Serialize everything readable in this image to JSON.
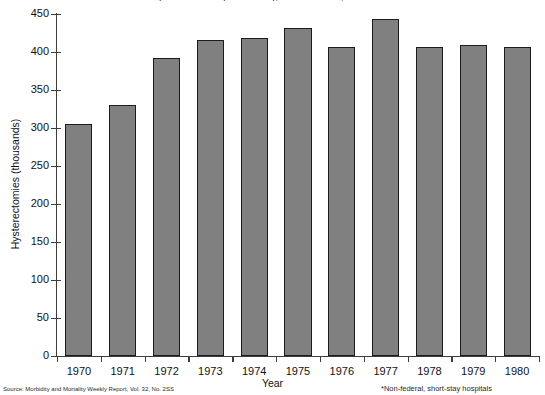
{
  "chart_data": {
    "type": "bar",
    "title": "Hysterectomies (thousands), United States, 1970-1980",
    "xlabel": "Year",
    "ylabel": "Hysterectomies (thousands)",
    "categories": [
      "1970",
      "1971",
      "1972",
      "1973",
      "1974",
      "1975",
      "1976",
      "1977",
      "1978",
      "1979",
      "1980"
    ],
    "values": [
      305,
      330,
      392,
      416,
      418,
      431,
      406,
      443,
      406,
      409,
      406
    ],
    "ylim": [
      0,
      450
    ],
    "ytick_values": [
      0,
      50,
      100,
      150,
      200,
      250,
      300,
      350,
      400,
      450
    ],
    "ytick_labels": [
      "0",
      "50",
      "100",
      "150",
      "200",
      "250",
      "300",
      "350",
      "400",
      "450"
    ],
    "grid": false,
    "legend": "none",
    "bar_color": "#808080",
    "bar_edge_color": "#1c1c1c",
    "axis_color": "#3d3d3d"
  },
  "notes": {
    "source": "Source: Morbidity and Mortality Weekly Report, Vol. 32, No. 2SS",
    "footnote": "*Non-federal, short-stay hospitals"
  }
}
